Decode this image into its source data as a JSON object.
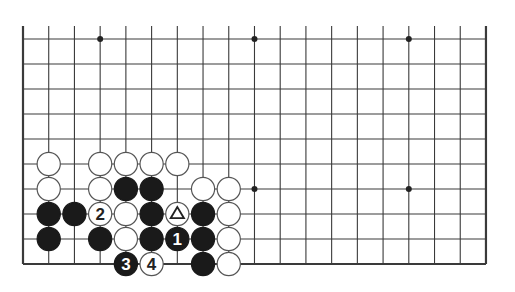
{
  "diagram": {
    "type": "go-board-fragment",
    "columns": 19,
    "rows": 10,
    "edges": {
      "left": true,
      "right": true,
      "bottom": true,
      "top": false
    },
    "star_points": [
      [
        3,
        0
      ],
      [
        9,
        0
      ],
      [
        15,
        0
      ],
      [
        9,
        6
      ],
      [
        15,
        6
      ]
    ],
    "stones": [
      {
        "col": 1,
        "row": 5,
        "color": "white"
      },
      {
        "col": 3,
        "row": 5,
        "color": "white"
      },
      {
        "col": 4,
        "row": 5,
        "color": "white"
      },
      {
        "col": 5,
        "row": 5,
        "color": "white"
      },
      {
        "col": 6,
        "row": 5,
        "color": "white"
      },
      {
        "col": 1,
        "row": 6,
        "color": "white"
      },
      {
        "col": 3,
        "row": 6,
        "color": "white"
      },
      {
        "col": 4,
        "row": 6,
        "color": "black"
      },
      {
        "col": 5,
        "row": 6,
        "color": "black"
      },
      {
        "col": 7,
        "row": 6,
        "color": "white"
      },
      {
        "col": 8,
        "row": 6,
        "color": "white"
      },
      {
        "col": 1,
        "row": 7,
        "color": "black"
      },
      {
        "col": 2,
        "row": 7,
        "color": "black"
      },
      {
        "col": 3,
        "row": 7,
        "color": "white",
        "label": "2"
      },
      {
        "col": 4,
        "row": 7,
        "color": "white"
      },
      {
        "col": 5,
        "row": 7,
        "color": "black"
      },
      {
        "col": 6,
        "row": 7,
        "color": "white",
        "mark": "triangle"
      },
      {
        "col": 7,
        "row": 7,
        "color": "black"
      },
      {
        "col": 8,
        "row": 7,
        "color": "white"
      },
      {
        "col": 1,
        "row": 8,
        "color": "black"
      },
      {
        "col": 3,
        "row": 8,
        "color": "black"
      },
      {
        "col": 4,
        "row": 8,
        "color": "white"
      },
      {
        "col": 5,
        "row": 8,
        "color": "black"
      },
      {
        "col": 6,
        "row": 8,
        "color": "black",
        "label": "1"
      },
      {
        "col": 7,
        "row": 8,
        "color": "black"
      },
      {
        "col": 8,
        "row": 8,
        "color": "white"
      },
      {
        "col": 4,
        "row": 9,
        "color": "black",
        "label": "3"
      },
      {
        "col": 5,
        "row": 9,
        "color": "white",
        "label": "4"
      },
      {
        "col": 7,
        "row": 9,
        "color": "black"
      },
      {
        "col": 8,
        "row": 9,
        "color": "white"
      }
    ],
    "colors": {
      "line": "#3a3a3a",
      "black_stone": "#1a1a1a",
      "white_stone": "#ffffff",
      "stone_outline": "#555555"
    }
  }
}
